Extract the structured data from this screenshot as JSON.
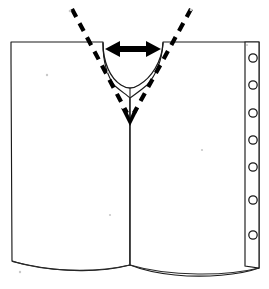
{
  "figure": {
    "background_color": "#ffffff",
    "line_color": "#1a1a1a",
    "accent_color": "#000000",
    "width_px": 269,
    "height_px": 289
  },
  "garment": {
    "name": "front-panel-outline",
    "description": "Open-front garment body with two panels and curved hem",
    "left_shoulder_label": "Left shoulder edge",
    "right_shoulder_label": "Right shoulder edge",
    "center_seam_label": "Center front seam",
    "hem_label": "Curved hem"
  },
  "neckline": {
    "name": "neckline-curve",
    "shape": "semicircle",
    "left_corner_x": 103,
    "right_corner_x": 163,
    "top_y": 42,
    "depth_y": 88
  },
  "binder_strip": {
    "name": "punch-hole-strip",
    "hole_count": 7,
    "hole_radius": 4.2,
    "hole_center_x": 253,
    "hole_positions_y": [
      58,
      85,
      113,
      140,
      167,
      200,
      235
    ],
    "strip_left_x": 245,
    "strip_right_x": 259,
    "strip_top_y": 42,
    "strip_bottom_y": 268
  },
  "annotations": {
    "width_arrow": {
      "name": "neck-width-double-arrow",
      "type": "double-headed-horizontal-arrow",
      "x_start": 105,
      "x_end": 161,
      "y": 49,
      "color": "#000000",
      "label": ""
    },
    "depth_guide": {
      "name": "v-depth-dashed-guide",
      "type": "dashed-v-lines-with-down-arrow",
      "left_start_x": 72,
      "left_start_y": 9,
      "right_start_x": 191,
      "right_start_y": 9,
      "apex_x": 130,
      "apex_y": 124,
      "color": "#000000",
      "label": ""
    }
  },
  "specks": [
    {
      "x": 70,
      "y": 11,
      "r": 1.3
    },
    {
      "x": 191,
      "y": 10,
      "r": 1.3
    },
    {
      "x": 47,
      "y": 75,
      "r": 1.2
    },
    {
      "x": 108,
      "y": 72,
      "r": 1.1
    },
    {
      "x": 110,
      "y": 215,
      "r": 1.1
    },
    {
      "x": 202,
      "y": 150,
      "r": 1.1
    },
    {
      "x": 20,
      "y": 272,
      "r": 1.2
    },
    {
      "x": 247,
      "y": 45,
      "r": 1.1
    }
  ]
}
